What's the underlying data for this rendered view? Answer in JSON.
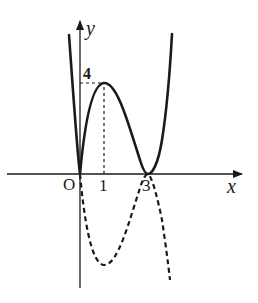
{
  "figure": {
    "title": "",
    "axes": {
      "x_label": "x",
      "y_label": "y",
      "origin_label": "O",
      "x_ticks": [
        "1",
        "3"
      ],
      "y_ticks": [
        "4"
      ]
    },
    "curves": [
      {
        "name": "solid-curve",
        "style": "solid",
        "description": "y = |x(x-3)^2|, passing through (0,0), peak (1,4), touching x-axis at (3,0)"
      },
      {
        "name": "dashed-curve",
        "style": "dashed",
        "description": "reflected negative branch, minimum at (1,-4), passing through (0,0) and (3,0)"
      }
    ],
    "guides": [
      {
        "name": "peak-vertical-guide",
        "from": [
          1,
          0
        ],
        "to": [
          1,
          4
        ],
        "style": "dashed"
      },
      {
        "name": "peak-horizontal-guide",
        "from": [
          0,
          4
        ],
        "to": [
          1,
          4
        ],
        "style": "dashed"
      }
    ],
    "key_points": [
      {
        "x": 0,
        "y": 0,
        "label": "O"
      },
      {
        "x": 1,
        "y": 4
      },
      {
        "x": 3,
        "y": 0
      },
      {
        "x": 1,
        "y": -4
      }
    ],
    "colors": {
      "ink": "#1a1a1a",
      "background": "#ffffff"
    }
  }
}
